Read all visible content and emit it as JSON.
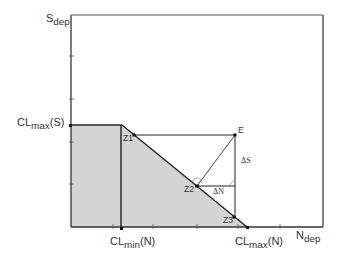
{
  "labels": {
    "y_axis_main": "S",
    "y_axis_sub": "dep",
    "x_axis_main": "N",
    "x_axis_sub": "dep",
    "cl_max_s_main": "CL",
    "cl_max_s_sub": "max",
    "cl_max_s_suffix": "(S)",
    "cl_min_n_main": "CL",
    "cl_min_n_sub": "min",
    "cl_min_n_suffix": "(N)",
    "cl_max_n_main": "CL",
    "cl_max_n_sub": "max",
    "cl_max_n_suffix": "(N)",
    "z1": "Z1",
    "z2": "Z2",
    "z3": "Z3",
    "e": "E",
    "delta_s": "ΔS",
    "delta_n": "ΔN"
  },
  "colors": {
    "axis": "#333333",
    "fill": "#d4d4d4",
    "line": "#222222"
  },
  "geometry": {
    "origin": [
      71,
      227
    ],
    "top_right": [
      323,
      15
    ],
    "cl_max_s_y": 125,
    "cl_min_n_x": 121,
    "cl_max_n_x": 247,
    "points": {
      "Z1": [
        134,
        135
      ],
      "Z2": [
        197,
        186
      ],
      "Z3": [
        234,
        217
      ],
      "E": [
        235,
        135
      ]
    }
  }
}
